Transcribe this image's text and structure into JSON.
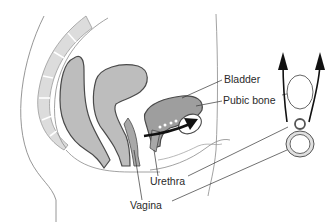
{
  "figure": {
    "colors": {
      "background": "#ffffff",
      "organ_fill": "#bdbdbd",
      "organ_fill_dark": "#9e9e9e",
      "outline": "#4a4a4a",
      "spine_fill": "#dcdcdc",
      "thin_line": "#8a8a8a",
      "arrow": "#111111",
      "text": "#2a2a2a"
    }
  },
  "labels": {
    "bladder": "Bladder",
    "pubic_bone": "Pubic bone",
    "urethra": "Urethra",
    "vagina": "Vagina"
  },
  "schematic": {
    "arrows": 2,
    "arrow_direction": "up",
    "shapes": [
      "pubic-bone-oval",
      "urethra-ring",
      "vagina-ring"
    ]
  }
}
